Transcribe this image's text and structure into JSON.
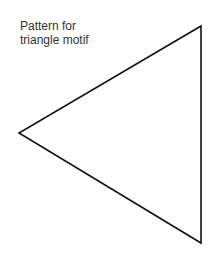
{
  "caption": {
    "line1": "Pattern for",
    "line2": "triangle motif"
  },
  "triangle": {
    "stroke_color": "#111111",
    "fill_color": "#ffffff",
    "points": [
      [
        201,
        26
      ],
      [
        19,
        133
      ],
      [
        201,
        243
      ]
    ]
  }
}
